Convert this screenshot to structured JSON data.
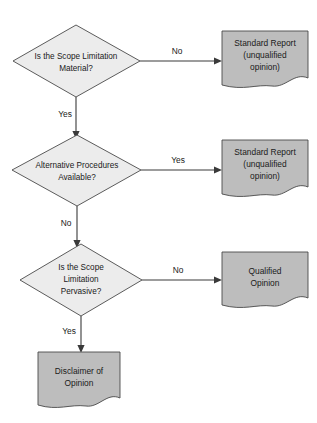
{
  "diagram": {
    "colors": {
      "decision_fill": "#ececec",
      "document_fill": "#bdbdbd",
      "stroke": "#4a4a4a",
      "connector": "#3a3a3a",
      "text": "#1a1a1a",
      "background": "#ffffff"
    },
    "nodes": [
      {
        "id": "decision-1",
        "shape": "diamond",
        "lines": [
          "Is the Scope Limitation",
          "Material?"
        ]
      },
      {
        "id": "document-1",
        "shape": "document",
        "lines": [
          "Standard Report",
          "(unqualified",
          "opinion)"
        ]
      },
      {
        "id": "decision-2",
        "shape": "diamond",
        "lines": [
          "Alternative Procedures",
          "Available?"
        ]
      },
      {
        "id": "document-2",
        "shape": "document",
        "lines": [
          "Standard Report",
          "(unqualified",
          "opinion)"
        ]
      },
      {
        "id": "decision-3",
        "shape": "diamond",
        "lines": [
          "Is the Scope",
          "Limitation",
          "Pervasive?"
        ]
      },
      {
        "id": "document-3",
        "shape": "document",
        "lines": [
          "Qualified",
          "Opinion"
        ]
      },
      {
        "id": "document-4",
        "shape": "document",
        "lines": [
          "Disclaimer of",
          "Opinion"
        ]
      }
    ],
    "edges": [
      {
        "id": "edge-1",
        "from": "decision-1",
        "to": "document-1",
        "label": "No"
      },
      {
        "id": "edge-2",
        "from": "decision-1",
        "to": "decision-2",
        "label": "Yes"
      },
      {
        "id": "edge-3",
        "from": "decision-2",
        "to": "document-2",
        "label": "Yes"
      },
      {
        "id": "edge-4",
        "from": "decision-2",
        "to": "decision-3",
        "label": "No"
      },
      {
        "id": "edge-5",
        "from": "decision-3",
        "to": "document-3",
        "label": "No"
      },
      {
        "id": "edge-6",
        "from": "decision-3",
        "to": "document-4",
        "label": "Yes"
      }
    ]
  }
}
